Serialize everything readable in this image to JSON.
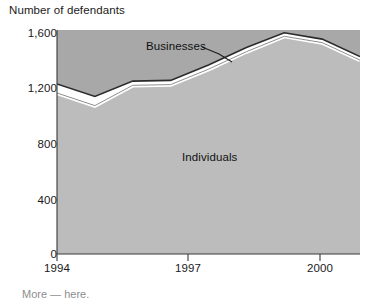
{
  "figure": {
    "axis_title": "Number of defendants",
    "series_labels": {
      "businesses": "Businesses",
      "individuals": "Individuals"
    },
    "caption_partial": "More — here.",
    "colors": {
      "upper_area": "#a8a8a8",
      "lower_area": "#bcbcbc",
      "boundary_line": "#2b2b2b",
      "gap": "#ffffff",
      "text": "#1a1a1a",
      "axis": "#3a3a3a",
      "background": "#ffffff"
    }
  },
  "chart_data": {
    "type": "area",
    "title": "",
    "subtitle": "",
    "xlabel": "",
    "ylabel": "Number of defendants",
    "grid": false,
    "legend_position": "in-plot-annotations",
    "stacked": true,
    "xlim": [
      1994,
      2002
    ],
    "ylim": [
      0,
      1600
    ],
    "yticks": [
      0,
      400,
      800,
      1200,
      1600
    ],
    "ytick_labels": [
      "0",
      "400",
      "800",
      "1,200",
      "1,600"
    ],
    "xticks": [
      1994,
      1997,
      2000
    ],
    "xtick_labels": [
      "1994",
      "1997",
      "2000"
    ],
    "x": [
      1994,
      1995,
      1996,
      1997,
      1998,
      1999,
      2000,
      2001,
      2002
    ],
    "series": [
      {
        "name": "Individuals",
        "values": [
          1150,
          1060,
          1205,
          1210,
          1320,
          1445,
          1555,
          1510,
          1385
        ]
      },
      {
        "name": "Businesses",
        "values": [
          65,
          65,
          30,
          30,
          30,
          30,
          25,
          25,
          25
        ]
      }
    ],
    "totals": [
      1215,
      1125,
      1235,
      1240,
      1350,
      1475,
      1580,
      1535,
      1410
    ],
    "annotations": [
      {
        "text": "Businesses",
        "x": 1996.2,
        "y": 1470,
        "leader_to": {
          "x": 1997.6,
          "y": 1300
        }
      },
      {
        "text": "Individuals",
        "x": 1997.9,
        "y": 720
      }
    ]
  }
}
